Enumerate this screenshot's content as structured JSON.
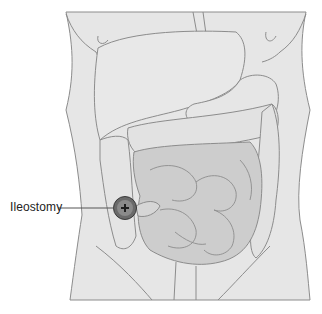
{
  "diagram": {
    "labels": [
      {
        "id": "ileostomy",
        "text": "Ileostomy"
      }
    ],
    "colors": {
      "background": "#ffffff",
      "body_fill": "#e6e6e6",
      "outline": "#8c8c8c",
      "intestine_fill": "#cdcdcd",
      "colon_fill": "#e2e2e2",
      "stoma_fill": "#5a5a5a",
      "leader_line": "#555555"
    }
  }
}
